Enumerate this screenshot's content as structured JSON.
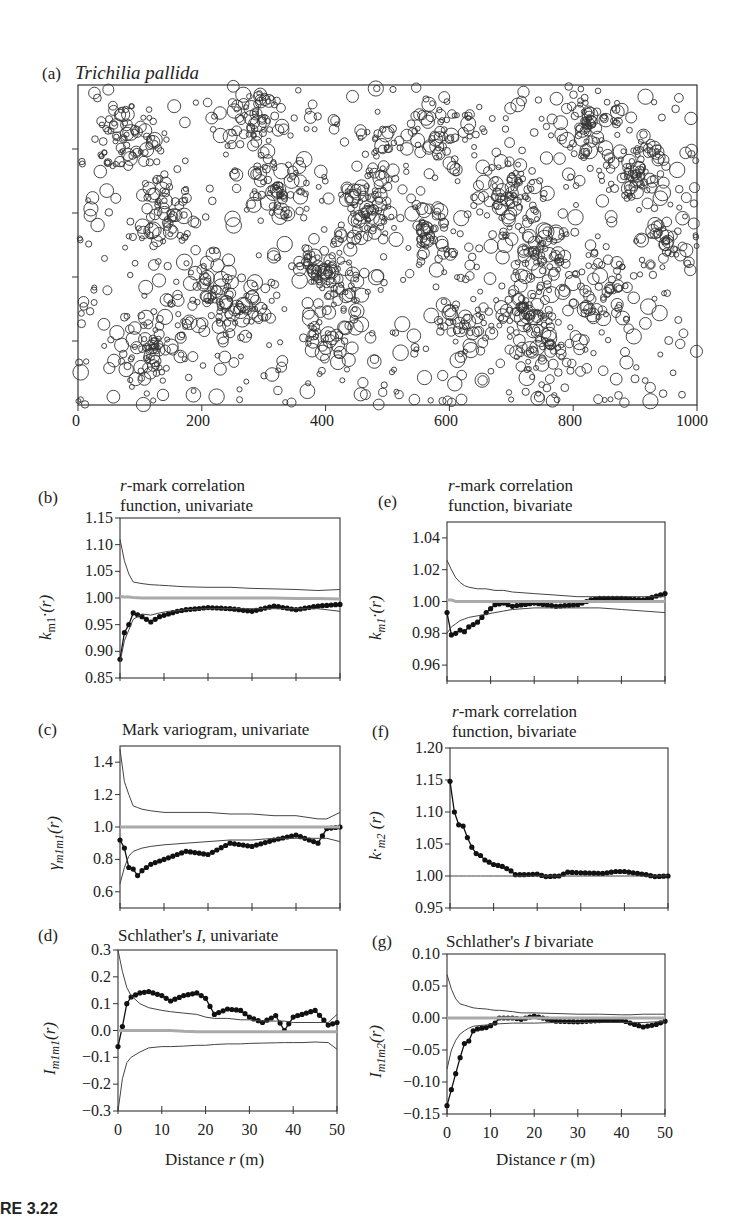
{
  "figure": {
    "caption_fragment": "RE 3.22",
    "panel_a": {
      "label": "(a)",
      "title": "Trichilia pallida",
      "x_ticks": [
        "0",
        "200",
        "400",
        "600",
        "800",
        "1000"
      ]
    },
    "panel_b": {
      "label": "(b)",
      "title_line1": "r-mark correlation",
      "title_line2": "function, univariate",
      "ylabel": "k_m1·(r)",
      "y_ticks": [
        "1.15",
        "1.10",
        "1.05",
        "1.00",
        "0.95",
        "0.90",
        "0.85"
      ]
    },
    "panel_c": {
      "label": "(c)",
      "title_line1": "Mark variogram, univariate",
      "ylabel": "γ_m1m1(r)",
      "y_ticks": [
        "1.4",
        "1.2",
        "1.0",
        "0.8",
        "0.6"
      ]
    },
    "panel_d": {
      "label": "(d)",
      "title_line1": "Schlather's I, univariate",
      "ylabel": "I_m1m1(r)",
      "y_ticks": [
        "0.3",
        "0.2",
        "0.1",
        "0.0",
        "−0.1",
        "−0.2",
        "−0.3"
      ],
      "x_ticks": [
        "0",
        "10",
        "20",
        "30",
        "40",
        "50"
      ],
      "xlabel": "Distance r (m)"
    },
    "panel_e": {
      "label": "(e)",
      "title_line1": "r-mark correlation",
      "title_line2": "function, bivariate",
      "ylabel": "k_m1·(r)",
      "y_ticks": [
        "1.04",
        "1.02",
        "1.00",
        "0.98",
        "0.96"
      ]
    },
    "panel_f": {
      "label": "(f)",
      "title_line1": "r-mark correlation",
      "title_line2": "function, bivariate",
      "ylabel": "k·m2 (r)",
      "y_ticks": [
        "1.20",
        "1.15",
        "1.10",
        "1.05",
        "1.00",
        "0.95"
      ]
    },
    "panel_g": {
      "label": "(g)",
      "title_line1": "Schlather's I bivariate",
      "ylabel": "I_m1m2(r)",
      "y_ticks": [
        "0.10",
        "0.05",
        "0.00",
        "−0.05",
        "−0.10",
        "−0.15"
      ],
      "x_ticks": [
        "0",
        "10",
        "20",
        "30",
        "40",
        "50"
      ],
      "xlabel": "Distance r (m)"
    }
  },
  "chart_data": [
    {
      "id": "a",
      "type": "scatter",
      "title": "Trichilia pallida",
      "xlabel": "",
      "ylabel": "",
      "xlim": [
        0,
        1000
      ],
      "ylim": [
        0,
        500
      ],
      "x_ticks": [
        0,
        200,
        400,
        600,
        800,
        1000
      ],
      "note": "Marked point pattern; circles sized by mark (tree size). Several thousand points, clustered near x≈200, 400, 700–800."
    },
    {
      "id": "b",
      "type": "line",
      "title": "r-mark correlation function, univariate",
      "xlabel": "Distance r (m)",
      "ylabel": "k_m1·(r)",
      "xlim": [
        0,
        50
      ],
      "ylim": [
        0.85,
        1.15
      ],
      "x": [
        0,
        1,
        2,
        3,
        5,
        7,
        9,
        11,
        13,
        15,
        20,
        25,
        30,
        35,
        40,
        45,
        50
      ],
      "series": [
        {
          "name": "observed",
          "values": [
            0.885,
            0.935,
            0.95,
            0.972,
            0.965,
            0.955,
            0.965,
            0.97,
            0.975,
            0.978,
            0.982,
            0.98,
            0.975,
            0.985,
            0.978,
            0.985,
            0.988
          ]
        },
        {
          "name": "upper envelope",
          "values": [
            1.11,
            1.07,
            1.045,
            1.03,
            1.027,
            1.025,
            1.024,
            1.023,
            1.022,
            1.021,
            1.02,
            1.02,
            1.018,
            1.017,
            1.016,
            1.014,
            1.016
          ]
        },
        {
          "name": "lower envelope",
          "values": [
            0.88,
            0.92,
            0.94,
            0.96,
            0.97,
            0.968,
            0.972,
            0.975,
            0.976,
            0.978,
            0.98,
            0.98,
            0.98,
            0.98,
            0.98,
            0.98,
            0.975
          ]
        },
        {
          "name": "expectation",
          "values": [
            1.003,
            1.002,
            1.002,
            1.001,
            1.0,
            1.0,
            1.0,
            1.0,
            1.0,
            1.0,
            1.0,
            1.0,
            1.0,
            1.0,
            0.999,
            0.999,
            0.998
          ]
        }
      ]
    },
    {
      "id": "c",
      "type": "line",
      "title": "Mark variogram, univariate",
      "xlabel": "Distance r (m)",
      "ylabel": "γ_m1m1(r)",
      "xlim": [
        0,
        50
      ],
      "ylim": [
        0.5,
        1.5
      ],
      "x": [
        0,
        1,
        2,
        3,
        4,
        5,
        7,
        10,
        15,
        20,
        25,
        30,
        35,
        40,
        45,
        47,
        50
      ],
      "series": [
        {
          "name": "observed",
          "values": [
            0.92,
            0.87,
            0.75,
            0.74,
            0.7,
            0.73,
            0.77,
            0.8,
            0.85,
            0.83,
            0.9,
            0.88,
            0.92,
            0.95,
            0.9,
            0.99,
            1.0
          ]
        },
        {
          "name": "upper envelope",
          "values": [
            1.48,
            1.28,
            1.2,
            1.13,
            1.12,
            1.11,
            1.1,
            1.09,
            1.09,
            1.09,
            1.08,
            1.08,
            1.07,
            1.07,
            1.05,
            1.05,
            1.09
          ]
        },
        {
          "name": "lower envelope",
          "values": [
            0.65,
            0.75,
            0.82,
            0.85,
            0.86,
            0.87,
            0.88,
            0.89,
            0.9,
            0.91,
            0.92,
            0.92,
            0.93,
            0.93,
            0.93,
            0.93,
            0.91
          ]
        },
        {
          "name": "expectation",
          "values": [
            1.0,
            1.0,
            1.0,
            1.0,
            1.0,
            1.0,
            1.0,
            1.0,
            1.0,
            1.0,
            1.0,
            1.0,
            1.0,
            1.0,
            1.0,
            1.0,
            1.0
          ]
        }
      ]
    },
    {
      "id": "d",
      "type": "line",
      "title": "Schlather's I, univariate",
      "xlabel": "Distance r (m)",
      "ylabel": "I_m1m1(r)",
      "xlim": [
        0,
        50
      ],
      "ylim": [
        -0.3,
        0.3
      ],
      "x": [
        0,
        1,
        2,
        3,
        5,
        7,
        10,
        12,
        15,
        18,
        20,
        22,
        25,
        28,
        30,
        33,
        36,
        38,
        40,
        42,
        45,
        48,
        50
      ],
      "series": [
        {
          "name": "observed",
          "values": [
            -0.06,
            0.015,
            0.1,
            0.125,
            0.14,
            0.145,
            0.13,
            0.11,
            0.13,
            0.14,
            0.12,
            0.06,
            0.08,
            0.075,
            0.05,
            0.03,
            0.055,
            0.0,
            0.05,
            0.06,
            0.075,
            0.02,
            0.03
          ]
        },
        {
          "name": "upper envelope",
          "values": [
            0.3,
            0.22,
            0.16,
            0.13,
            0.1,
            0.085,
            0.075,
            0.07,
            0.065,
            0.06,
            0.05,
            0.045,
            0.045,
            0.04,
            0.04,
            0.035,
            0.035,
            0.035,
            0.03,
            0.03,
            0.03,
            0.03,
            0.06
          ]
        },
        {
          "name": "lower envelope",
          "values": [
            -0.3,
            -0.18,
            -0.12,
            -0.1,
            -0.08,
            -0.065,
            -0.06,
            -0.06,
            -0.058,
            -0.055,
            -0.055,
            -0.052,
            -0.05,
            -0.05,
            -0.048,
            -0.047,
            -0.046,
            -0.045,
            -0.045,
            -0.045,
            -0.043,
            -0.045,
            -0.07
          ]
        },
        {
          "name": "expectation",
          "values": [
            0.0,
            0.0,
            0.0,
            0.0,
            0.0,
            0.0,
            0.0,
            0.0,
            -0.003,
            -0.005,
            -0.005,
            -0.005,
            -0.005,
            -0.005,
            -0.005,
            -0.005,
            -0.005,
            -0.005,
            -0.005,
            -0.005,
            -0.005,
            -0.005,
            -0.005
          ]
        }
      ]
    },
    {
      "id": "e",
      "type": "line",
      "title": "r-mark correlation function, bivariate",
      "xlabel": "Distance r (m)",
      "ylabel": "k_m1·(r)",
      "xlim": [
        0,
        50
      ],
      "ylim": [
        0.95,
        1.05
      ],
      "x": [
        0,
        1,
        2,
        3,
        4,
        5,
        7,
        9,
        11,
        13,
        15,
        20,
        25,
        30,
        33,
        35,
        40,
        45,
        50
      ],
      "series": [
        {
          "name": "observed",
          "values": [
            0.993,
            0.979,
            0.98,
            0.982,
            0.981,
            0.984,
            0.987,
            0.993,
            0.998,
            0.999,
            0.997,
            0.999,
            0.997,
            0.998,
            1.001,
            1.002,
            1.002,
            1.001,
            1.005
          ]
        },
        {
          "name": "upper envelope",
          "values": [
            1.026,
            1.02,
            1.015,
            1.012,
            1.01,
            1.009,
            1.008,
            1.008,
            1.007,
            1.007,
            1.006,
            1.005,
            1.004,
            1.003,
            1.003,
            1.003,
            1.003,
            1.003,
            1.003
          ]
        },
        {
          "name": "lower envelope",
          "values": [
            0.98,
            0.984,
            0.986,
            0.988,
            0.989,
            0.99,
            0.991,
            0.992,
            0.993,
            0.994,
            0.995,
            0.996,
            0.996,
            0.996,
            0.996,
            0.996,
            0.995,
            0.994,
            0.993
          ]
        },
        {
          "name": "expectation",
          "values": [
            1.001,
            1.001,
            1.0,
            1.0,
            1.0,
            1.0,
            1.0,
            1.0,
            1.0,
            1.0,
            1.0,
            1.0,
            1.0,
            1.0,
            1.0,
            1.0,
            1.0,
            1.0,
            1.0
          ]
        }
      ]
    },
    {
      "id": "f",
      "type": "line",
      "title": "r-mark correlation function, bivariate",
      "xlabel": "Distance r (m)",
      "ylabel": "k·m2 (r)",
      "xlim": [
        0,
        50
      ],
      "ylim": [
        0.95,
        1.2
      ],
      "x": [
        0,
        1,
        2,
        3,
        4,
        5,
        6,
        7,
        8,
        10,
        12,
        14,
        15,
        17,
        20,
        22,
        25,
        27,
        30,
        35,
        38,
        40,
        45,
        47,
        50
      ],
      "series": [
        {
          "name": "observed",
          "values": [
            1.148,
            1.1,
            1.08,
            1.078,
            1.06,
            1.045,
            1.035,
            1.032,
            1.025,
            1.018,
            1.015,
            1.008,
            1.002,
            1.002,
            1.003,
            0.999,
            1.0,
            1.006,
            1.005,
            1.004,
            1.007,
            1.007,
            1.002,
            0.999,
            1.0
          ]
        },
        {
          "name": "reference",
          "values": [
            1.0,
            1.0,
            1.0,
            1.0,
            1.0,
            1.0,
            1.0,
            1.0,
            1.0,
            1.0,
            1.0,
            1.0,
            1.0,
            1.0,
            1.0,
            1.0,
            1.0,
            1.0,
            1.0,
            1.0,
            1.0,
            1.0,
            1.0,
            1.0,
            1.0
          ]
        }
      ]
    },
    {
      "id": "g",
      "type": "line",
      "title": "Schlather's I bivariate",
      "xlabel": "Distance r (m)",
      "ylabel": "I_m1m2(r)",
      "xlim": [
        0,
        50
      ],
      "ylim": [
        -0.15,
        0.1
      ],
      "x": [
        0,
        1,
        2,
        3,
        4,
        5,
        6,
        7,
        9,
        10,
        11,
        12,
        15,
        17,
        20,
        25,
        30,
        35,
        40,
        42,
        45,
        48,
        50
      ],
      "series": [
        {
          "name": "observed",
          "values": [
            -0.137,
            -0.112,
            -0.087,
            -0.062,
            -0.04,
            -0.036,
            -0.02,
            -0.017,
            -0.015,
            -0.012,
            -0.008,
            0.0,
            0.0,
            -0.002,
            0.003,
            -0.005,
            -0.006,
            -0.004,
            -0.003,
            -0.008,
            -0.014,
            -0.01,
            -0.005
          ]
        },
        {
          "name": "upper envelope",
          "values": [
            0.068,
            0.045,
            0.03,
            0.022,
            0.02,
            0.018,
            0.016,
            0.015,
            0.014,
            0.013,
            0.012,
            0.012,
            0.01,
            0.008,
            0.008,
            0.007,
            0.006,
            0.006,
            0.005,
            0.005,
            0.006,
            0.006,
            0.006
          ]
        },
        {
          "name": "lower envelope",
          "values": [
            -0.08,
            -0.05,
            -0.035,
            -0.025,
            -0.02,
            -0.016,
            -0.013,
            -0.012,
            -0.011,
            -0.01,
            -0.009,
            -0.009,
            -0.008,
            -0.008,
            -0.008,
            -0.007,
            -0.007,
            -0.007,
            -0.007,
            -0.007,
            -0.007,
            -0.006,
            -0.006
          ]
        },
        {
          "name": "expectation",
          "values": [
            0.0,
            0.0,
            0.0,
            0.0,
            0.0,
            0.0,
            0.0,
            0.0,
            0.0,
            0.0,
            0.0,
            0.0,
            0.0,
            0.0,
            0.0,
            0.0,
            0.0,
            0.0,
            0.0,
            0.0,
            0.0,
            0.0,
            0.0
          ]
        }
      ]
    }
  ]
}
